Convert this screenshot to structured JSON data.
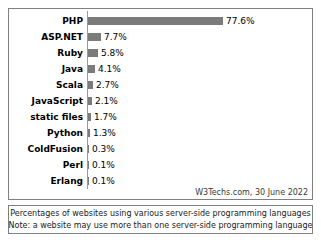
{
  "chart_data": {
    "type": "bar",
    "orientation": "horizontal",
    "categories": [
      "PHP",
      "ASP.NET",
      "Ruby",
      "Java",
      "Scala",
      "JavaScript",
      "static files",
      "Python",
      "ColdFusion",
      "Perl",
      "Erlang"
    ],
    "values": [
      77.6,
      7.7,
      5.8,
      4.1,
      2.7,
      2.1,
      1.7,
      1.3,
      0.3,
      0.1,
      0.1
    ],
    "value_labels": [
      "77.6%",
      "7.7%",
      "5.8%",
      "4.1%",
      "2.7%",
      "2.1%",
      "1.7%",
      "1.3%",
      "0.3%",
      "0.1%",
      "0.1%"
    ],
    "title": "",
    "xlabel": "",
    "ylabel": "",
    "xlim": [
      0,
      77.6
    ],
    "grid": false,
    "legend": false,
    "bar_color": "#7b7b7b",
    "unit": "%"
  },
  "source": {
    "text": "W3Techs.com, 30 June 2022"
  },
  "footer": {
    "line1": "Percentages of websites using various server-side programming languages",
    "line2": "Note: a website may use more than one server-side programming language"
  }
}
